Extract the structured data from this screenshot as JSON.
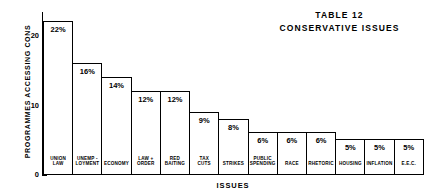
{
  "chart_data": {
    "type": "bar",
    "title": "TABLE 12",
    "subtitle": "CONSERVATIVE ISSUES",
    "xlabel": "ISSUES",
    "ylabel": "PROGRAMMES ACCESSING CONS",
    "ylim": [
      0,
      23.5
    ],
    "yticks": [
      0,
      10,
      20
    ],
    "ytick_labels": [
      "0",
      "10",
      "20"
    ],
    "grid": false,
    "legend": null,
    "categories": [
      "UNION\nLAW",
      "UNEMP -\nLOYMENT",
      "ECONOMY",
      "LAW +\nORDER",
      "RED\nBAITING",
      "TAX\nCUTS",
      "STRIKES",
      "PUBLIC\nSPENDING",
      "RACE",
      "RHETORIC",
      "HOUSING",
      "INFLATION",
      "E.E.C."
    ],
    "values": [
      22,
      16,
      14,
      12,
      12,
      9,
      8,
      6,
      6,
      6,
      5,
      5,
      5
    ],
    "data_labels": [
      "22%",
      "16%",
      "14%",
      "12%",
      "12%",
      "9%",
      "8%",
      "6%",
      "6%",
      "6%",
      "5%",
      "5%",
      "5%"
    ],
    "bar_face_color": "#ffffff",
    "bar_edge_color": "#000000",
    "background_color": "#ffffff",
    "text_color": "#000000"
  }
}
